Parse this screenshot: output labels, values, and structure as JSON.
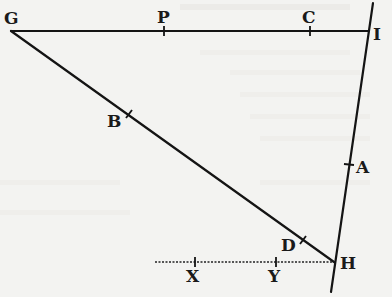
{
  "diagram": {
    "background": "#f3f3f1",
    "stroke_color": "#141414",
    "points": {
      "G": {
        "label": "G",
        "x": 11,
        "y": 31
      },
      "P": {
        "label": "P",
        "x": 164,
        "y": 31
      },
      "C": {
        "label": "C",
        "x": 310,
        "y": 31
      },
      "I": {
        "label": "I",
        "x": 367,
        "y": 31
      },
      "A": {
        "label": "A",
        "x": 349,
        "y": 165
      },
      "B": {
        "label": "B",
        "x": 129,
        "y": 114
      },
      "D": {
        "label": "D",
        "x": 303,
        "y": 240
      },
      "H": {
        "label": "H",
        "x": 334,
        "y": 262
      },
      "X": {
        "label": "X",
        "x": 195,
        "y": 262
      },
      "Y": {
        "label": "Y",
        "x": 276,
        "y": 262
      }
    },
    "segments": [
      {
        "name": "GI",
        "from": "G",
        "to": "I",
        "style": "solid"
      },
      {
        "name": "GH",
        "from": "G",
        "to": "H",
        "style": "solid"
      },
      {
        "name": "IH-extended",
        "from": "top",
        "to": "bottom",
        "style": "solid"
      },
      {
        "name": "XH",
        "from": "left-end",
        "to": "H",
        "style": "dotted"
      }
    ]
  }
}
